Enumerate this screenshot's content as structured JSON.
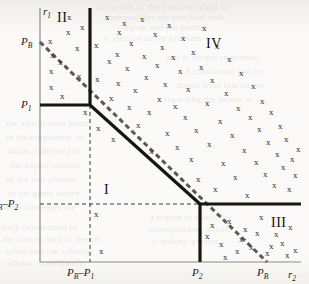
{
  "figure": {
    "width": 309,
    "height": 284,
    "background": "#fbfaf8",
    "ink": "#1c1b19"
  },
  "axes": {
    "y_axis_label": "r",
    "y_axis_sub": "1",
    "x_axis_label": "r",
    "x_axis_sub": "2",
    "origin": {
      "x": 40,
      "y": 262
    },
    "x_end": 301,
    "y_top": 8
  },
  "y_ticks": [
    {
      "id": "pb",
      "label": "P",
      "sub": "B",
      "value_y": 42,
      "show_tick": false
    },
    {
      "id": "p1",
      "label": "P",
      "sub": "1",
      "value_y": 105,
      "show_tick": false
    },
    {
      "id": "pbp2",
      "label": "P",
      "sub": "B",
      "label2": "–P",
      "sub2": "2",
      "value_y": 204,
      "show_tick": false
    }
  ],
  "x_ticks": [
    {
      "id": "pbp1",
      "label": "P",
      "sub": "B",
      "label2": "–P",
      "sub2": "1",
      "value_x": 90
    },
    {
      "id": "p2",
      "label": "P",
      "sub": "2",
      "value_x": 200
    },
    {
      "id": "pb",
      "label": "P",
      "sub": "B",
      "value_x": 265
    }
  ],
  "regions": [
    {
      "id": "I",
      "label": "I",
      "x": 104,
      "y": 182
    },
    {
      "id": "II",
      "label": "II",
      "x": 57,
      "y": 10
    },
    {
      "id": "III",
      "label": "III",
      "x": 271,
      "y": 215
    },
    {
      "id": "IV",
      "label": "IV",
      "x": 206,
      "y": 36
    }
  ],
  "solid_boundary": {
    "color": "#17160f",
    "width": 3.2,
    "segments": [
      {
        "name": "vertical-upper",
        "x1": 90,
        "y1": 8,
        "x2": 90,
        "y2": 105
      },
      {
        "name": "horizontal-p1",
        "x1": 40,
        "y1": 105,
        "x2": 90,
        "y2": 105
      },
      {
        "name": "diagonal-main",
        "x1": 90,
        "y1": 105,
        "x2": 200,
        "y2": 204
      },
      {
        "name": "vertical-lower",
        "x1": 200,
        "y1": 204,
        "x2": 200,
        "y2": 262
      },
      {
        "name": "horizontal-right",
        "x1": 200,
        "y1": 204,
        "x2": 301,
        "y2": 204
      }
    ]
  },
  "dashed_diagonal": {
    "name": "budget-line",
    "color": "#5b5952",
    "width": 3.0,
    "dash": "5,3.5",
    "x1": 40,
    "y1": 42,
    "x2": 267,
    "y2": 262
  },
  "dashed_guides": {
    "color": "#3b3a36",
    "width": 1.0,
    "dash": "4,3",
    "lines": [
      {
        "name": "guide-vertical-pbp1",
        "x1": 90,
        "y1": 105,
        "x2": 90,
        "y2": 262
      },
      {
        "name": "guide-horizontal-pbp2",
        "x1": 40,
        "y1": 204,
        "x2": 200,
        "y2": 204
      }
    ]
  },
  "frame": {
    "color": "#8d8b85",
    "width": 1.2
  },
  "scatter_marks": {
    "glyph": "x",
    "points": [
      [
        51,
        42
      ],
      [
        53,
        56
      ],
      [
        52,
        72
      ],
      [
        52,
        88
      ],
      [
        61,
        63
      ],
      [
        63,
        97
      ],
      [
        70,
        18
      ],
      [
        69,
        33
      ],
      [
        83,
        28
      ],
      [
        78,
        49
      ],
      [
        80,
        77
      ],
      [
        86,
        113
      ],
      [
        97,
        46
      ],
      [
        98,
        80
      ],
      [
        99,
        129
      ],
      [
        108,
        18
      ],
      [
        110,
        62
      ],
      [
        112,
        99
      ],
      [
        114,
        140
      ],
      [
        120,
        33
      ],
      [
        118,
        55
      ],
      [
        119,
        84
      ],
      [
        125,
        24
      ],
      [
        128,
        69
      ],
      [
        130,
        108
      ],
      [
        132,
        44
      ],
      [
        136,
        91
      ],
      [
        139,
        126
      ],
      [
        143,
        20
      ],
      [
        145,
        57
      ],
      [
        147,
        78
      ],
      [
        150,
        113
      ],
      [
        152,
        152
      ],
      [
        156,
        35
      ],
      [
        158,
        66
      ],
      [
        160,
        100
      ],
      [
        163,
        48
      ],
      [
        166,
        85
      ],
      [
        168,
        134
      ],
      [
        170,
        26
      ],
      [
        174,
        58
      ],
      [
        176,
        107
      ],
      [
        178,
        148
      ],
      [
        181,
        72
      ],
      [
        184,
        39
      ],
      [
        186,
        118
      ],
      [
        189,
        90
      ],
      [
        192,
        160
      ],
      [
        194,
        53
      ],
      [
        197,
        131
      ],
      [
        199,
        180
      ],
      [
        202,
        68
      ],
      [
        205,
        29
      ],
      [
        208,
        104
      ],
      [
        210,
        145
      ],
      [
        213,
        81
      ],
      [
        216,
        190
      ],
      [
        218,
        47
      ],
      [
        221,
        122
      ],
      [
        224,
        164
      ],
      [
        227,
        94
      ],
      [
        230,
        60
      ],
      [
        233,
        136
      ],
      [
        236,
        178
      ],
      [
        239,
        109
      ],
      [
        242,
        74
      ],
      [
        245,
        151
      ],
      [
        248,
        196
      ],
      [
        251,
        118
      ],
      [
        254,
        87
      ],
      [
        257,
        163
      ],
      [
        260,
        130
      ],
      [
        263,
        102
      ],
      [
        266,
        175
      ],
      [
        269,
        143
      ],
      [
        272,
        113
      ],
      [
        275,
        186
      ],
      [
        278,
        155
      ],
      [
        281,
        127
      ],
      [
        284,
        168
      ],
      [
        287,
        140
      ],
      [
        290,
        190
      ],
      [
        293,
        160
      ],
      [
        296,
        176
      ],
      [
        299,
        150
      ],
      [
        213,
        226
      ],
      [
        230,
        222
      ],
      [
        246,
        230
      ],
      [
        262,
        218
      ],
      [
        277,
        235
      ],
      [
        291,
        228
      ],
      [
        222,
        245
      ],
      [
        238,
        252
      ],
      [
        252,
        248
      ],
      [
        268,
        254
      ],
      [
        283,
        244
      ],
      [
        296,
        251
      ],
      [
        208,
        237
      ],
      [
        226,
        258
      ],
      [
        242,
        240
      ],
      [
        258,
        234
      ],
      [
        272,
        247
      ],
      [
        288,
        256
      ],
      [
        102,
        252
      ],
      [
        97,
        215
      ]
    ]
  },
  "ghost_background_text": [
    {
      "text": "to the left of the x and the right of",
      "x": 96,
      "y": 2
    },
    {
      "text": "inequalities are satisfied with",
      "x": 110,
      "y": 12
    },
    {
      "text": "region and the points",
      "x": 122,
      "y": 22
    },
    {
      "text": "a solution to the problem",
      "x": 104,
      "y": 33
    },
    {
      "text": "and is unique in general",
      "x": 166,
      "y": 52
    },
    {
      "text": "A conclusion can be",
      "x": 184,
      "y": 66
    },
    {
      "text": "drawn from this figure",
      "x": 176,
      "y": 80
    },
    {
      "text": "regarding the nature of",
      "x": 164,
      "y": 94
    },
    {
      "text": "the equilibrium points",
      "x": 6,
      "y": 118
    },
    {
      "text": "in the bargaining set",
      "x": 6,
      "y": 132
    },
    {
      "text": "which is defined by",
      "x": 6,
      "y": 146
    },
    {
      "text": "the payoff vectors",
      "x": 10,
      "y": 160
    },
    {
      "text": "of the two players",
      "x": 6,
      "y": 174
    },
    {
      "text": "in the game where",
      "x": 8,
      "y": 188
    },
    {
      "text": "their strategies are",
      "x": 4,
      "y": 202
    },
    {
      "text": "each constrained to",
      "x": 2,
      "y": 222
    },
    {
      "text": "the convex hull of the set",
      "x": 2,
      "y": 234
    },
    {
      "text": "given and the solution",
      "x": 6,
      "y": 246
    },
    {
      "text": "follows immediately",
      "x": 4,
      "y": 258
    },
    {
      "text": "a region in which the",
      "x": 150,
      "y": 212
    },
    {
      "text": "corresponding payoff",
      "x": 148,
      "y": 224
    },
    {
      "text": "is strictly greater",
      "x": 152,
      "y": 236
    }
  ]
}
